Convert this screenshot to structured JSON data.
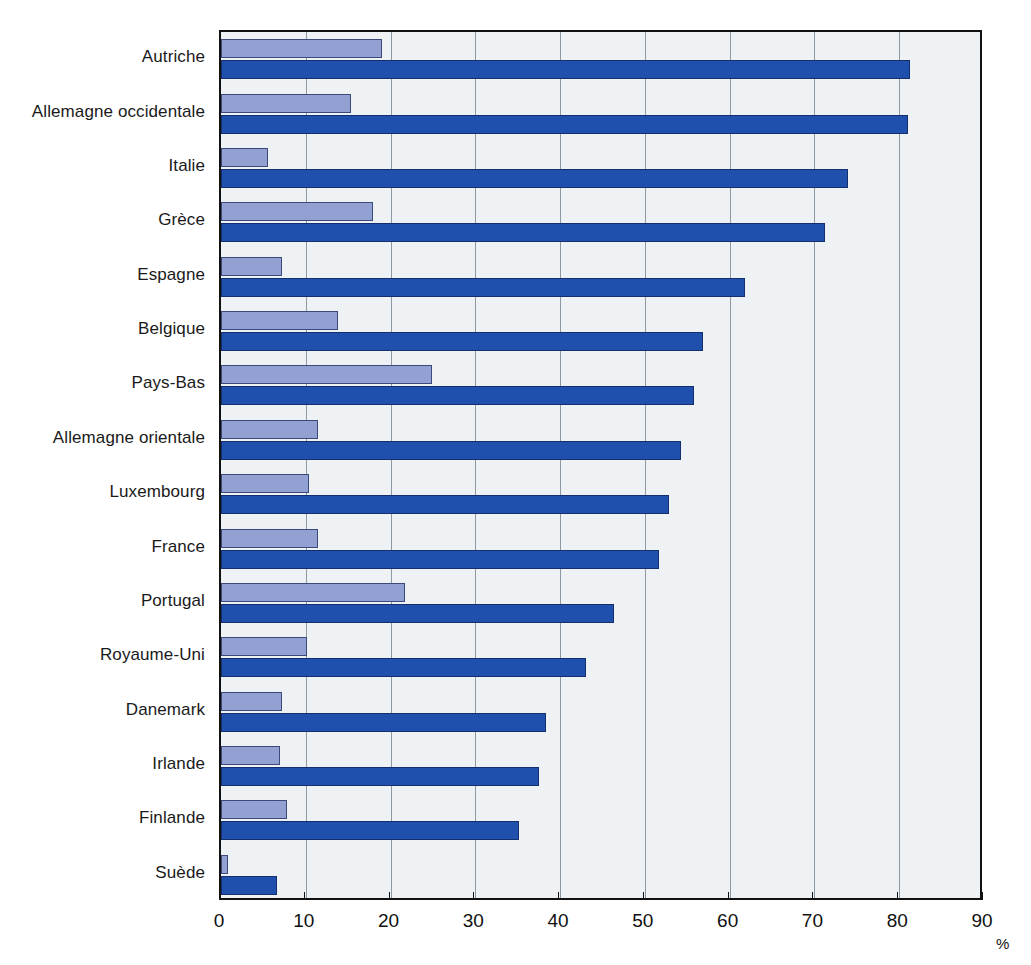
{
  "chart_data": {
    "type": "bar",
    "orientation": "horizontal",
    "title": "",
    "subtitle": "",
    "xlabel": "%",
    "ylabel": "",
    "xlim": [
      0,
      90
    ],
    "xticks": [
      0,
      10,
      20,
      30,
      40,
      50,
      60,
      70,
      80,
      90
    ],
    "xtick_labels": [
      "0",
      "10",
      "20",
      "30",
      "40",
      "50",
      "60",
      "70",
      "80",
      "90"
    ],
    "grid": "vertical",
    "legend": "none",
    "categories": [
      "Autriche",
      "Allemagne occidentale",
      "Italie",
      "Grèce",
      "Espagne",
      "Belgique",
      "Pays-Bas",
      "Allemagne orientale",
      "Luxembourg",
      "France",
      "Portugal",
      "Royaume-Uni",
      "Danemark",
      "Irlande",
      "Finlande",
      "Suède"
    ],
    "series": [
      {
        "name": "série-claire",
        "color": "#93a0d2",
        "values": [
          19.0,
          15.3,
          5.5,
          17.9,
          7.2,
          13.8,
          24.9,
          11.5,
          10.4,
          11.4,
          21.7,
          10.2,
          7.2,
          7.0,
          7.8,
          0.8
        ]
      },
      {
        "name": "série-foncée",
        "color": "#2050ae",
        "values": [
          81.3,
          81.0,
          74.0,
          71.3,
          61.8,
          56.8,
          55.8,
          54.3,
          52.8,
          51.7,
          46.3,
          43.0,
          38.3,
          37.5,
          35.1,
          6.6
        ]
      }
    ]
  },
  "colors": {
    "light_bar": "#93a0d2",
    "dark_bar": "#2050ae",
    "plot_background": "#eef2f5",
    "gridline": "#8d9aa3",
    "frame": "#111111",
    "text": "#1a1a1a"
  }
}
